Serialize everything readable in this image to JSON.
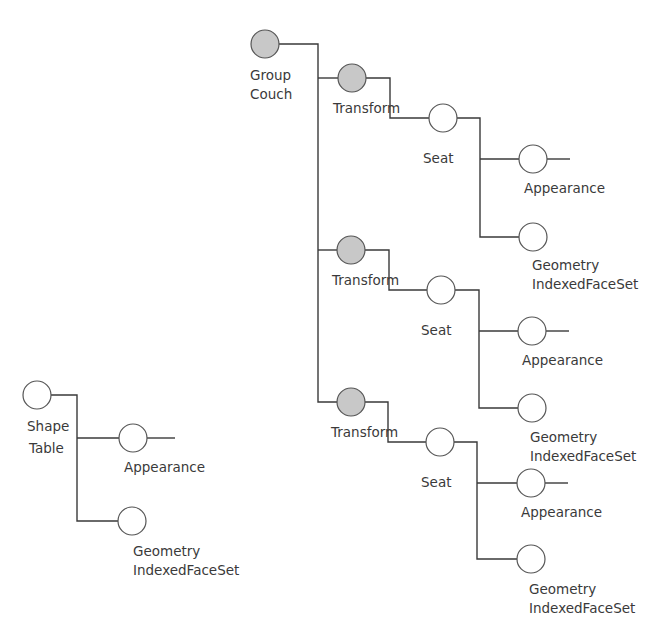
{
  "diagram": {
    "type": "scene-graph-tree",
    "colors": {
      "filled_node": "#c8c8c8",
      "empty_node": "#ffffff",
      "stroke": "#555555",
      "edge": "#3a3a3a",
      "text": "#3a3a3a"
    },
    "couch": {
      "group": {
        "line1": "Group",
        "line2": "Couch"
      },
      "branches": [
        {
          "transform": "Transform",
          "seat": "Seat",
          "appearance": "Appearance",
          "geometry": {
            "line1": "Geometry",
            "line2": "IndexedFaceSet"
          }
        },
        {
          "transform": "Transform",
          "seat": "Seat",
          "appearance": "Appearance",
          "geometry": {
            "line1": "Geometry",
            "line2": "IndexedFaceSet"
          }
        },
        {
          "transform": "Transform",
          "seat": "Seat",
          "appearance": "Appearance",
          "geometry": {
            "line1": "Geometry",
            "line2": "IndexedFaceSet"
          }
        }
      ]
    },
    "table": {
      "shape": {
        "line1": "Shape",
        "line2": "Table"
      },
      "appearance": "Appearance",
      "geometry": {
        "line1": "Geometry",
        "line2": "IndexedFaceSet"
      }
    }
  }
}
